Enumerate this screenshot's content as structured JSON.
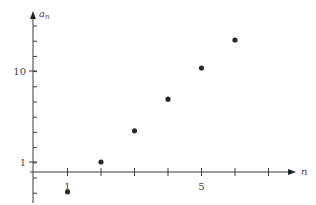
{
  "chart_data": {
    "type": "scatter",
    "title": "",
    "xlabel": "n",
    "ylabel": "a_n",
    "ylabel_main": "a",
    "ylabel_sub": "n",
    "yscale": "log",
    "x": [
      1,
      2,
      3,
      4,
      5,
      6
    ],
    "values": [
      0.47,
      1.0,
      2.2,
      4.9,
      10.8,
      21.9
    ],
    "x_tick_values": [
      1,
      2,
      3,
      4,
      5,
      6,
      7
    ],
    "x_tick_labels": [
      {
        "value": 1,
        "label": "1"
      },
      {
        "value": 5,
        "label": "5"
      }
    ],
    "y_tick_labels": [
      {
        "value": 1,
        "label": "1"
      },
      {
        "value": 10,
        "label": "10"
      }
    ],
    "xlim": [
      0,
      8
    ],
    "ylim": [
      0.3,
      40
    ],
    "grid": false,
    "legend": null,
    "colors": {
      "axis": "#3a3a3a",
      "point": "#2a2a2a"
    }
  }
}
